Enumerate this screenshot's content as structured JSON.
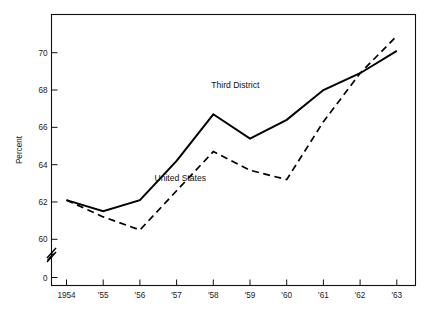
{
  "chart_data": {
    "type": "line",
    "title": "",
    "subtitle": "",
    "xlabel": "",
    "ylabel": "Percent",
    "x": [
      1954,
      1955,
      1956,
      1957,
      1958,
      1959,
      1960,
      1961,
      1962,
      1963
    ],
    "xtick_labels": [
      "1954",
      "'55",
      "'56",
      "'57",
      "'58",
      "'59",
      "'60",
      "'61",
      "'62",
      "'63"
    ],
    "ytick_labels": [
      "0",
      "60",
      "62",
      "64",
      "66",
      "68",
      "70"
    ],
    "ytick_values": [
      0,
      60,
      62,
      64,
      66,
      68,
      70
    ],
    "ylim": [
      59.2,
      71.6
    ],
    "xlim": [
      1953.6,
      1963.5
    ],
    "y_axis_break": true,
    "grid": false,
    "legend_position": "inline-annotation",
    "series": [
      {
        "name": "Third District",
        "style": "solid",
        "color": "#000000",
        "label_x": 1958.6,
        "label_y": 68.1,
        "values": [
          62.1,
          61.5,
          62.1,
          64.2,
          66.7,
          65.4,
          66.4,
          68.0,
          68.9,
          70.1
        ]
      },
      {
        "name": "United States",
        "style": "dashed",
        "color": "#000000",
        "label_x": 1957.1,
        "label_y": 63.1,
        "values": [
          62.1,
          61.2,
          60.5,
          62.6,
          64.7,
          63.7,
          63.2,
          66.3,
          68.9,
          70.9
        ]
      }
    ],
    "annotations": [
      {
        "name": "axis-break",
        "text": "",
        "x": 1953.75,
        "y": 59.6
      }
    ]
  },
  "figure": {
    "background_color": "#ffffff",
    "axis_color": "#111111",
    "width": 435,
    "height": 317
  }
}
